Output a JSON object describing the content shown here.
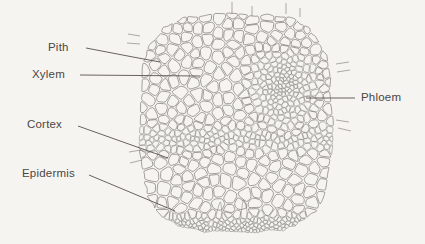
{
  "figure": {
    "kind": "plant-stem-cross-section-micrograph-drawing",
    "background_color": "#f6f4f1",
    "line_color": "#6f6c68",
    "text_color": "#4a4744"
  },
  "labels": [
    {
      "id": "pith",
      "text": "Pith",
      "side": "left",
      "text_x": 48,
      "text_y": 41,
      "leader": [
        [
          86,
          48
        ],
        [
          133,
          57
        ],
        [
          160,
          62
        ]
      ]
    },
    {
      "id": "xylem",
      "text": "Xylem",
      "side": "left",
      "text_x": 32,
      "text_y": 68,
      "leader": [
        [
          80,
          75
        ],
        [
          200,
          76
        ]
      ]
    },
    {
      "id": "cortex",
      "text": "Cortex",
      "side": "left",
      "text_x": 27,
      "text_y": 118,
      "leader": [
        [
          78,
          126
        ],
        [
          168,
          158
        ]
      ]
    },
    {
      "id": "epidermis",
      "text": "Epidermis",
      "side": "left",
      "text_x": 22,
      "text_y": 167,
      "leader": [
        [
          89,
          175
        ],
        [
          175,
          211
        ]
      ]
    },
    {
      "id": "phloem",
      "text": "Phloem",
      "side": "right",
      "text_x": 361,
      "text_y": 91,
      "leader": [
        [
          355,
          98
        ],
        [
          306,
          98
        ]
      ]
    }
  ],
  "tissue_regions": [
    {
      "name": "pith",
      "description": "large rounded parenchyma cells, upper-left region"
    },
    {
      "name": "xylem",
      "description": "large vessel cells in the inner band"
    },
    {
      "name": "phloem",
      "description": "dense cluster of very small cells, right of centre"
    },
    {
      "name": "cortex",
      "description": "large rounded cells, lower region"
    },
    {
      "name": "epidermis",
      "description": "single outer row of small uniform cells at the lower edge"
    }
  ],
  "section_bounds": {
    "left": 140,
    "right": 332,
    "top": 14,
    "bottom": 230
  }
}
